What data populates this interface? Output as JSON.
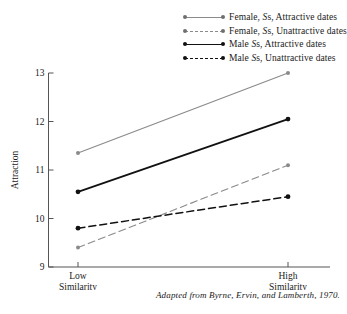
{
  "figure": {
    "caption": "Adapted from Byrne, Ervin, and Lamberth, 1970."
  },
  "legend": {
    "position": "top-right",
    "items": [
      {
        "prefix": "Female, ",
        "sym_italic": "S",
        "sym_roman": "s",
        "suffix": ", Attractive dates",
        "full": "Female, Ss, Attractive dates",
        "color": "#8a8a8a",
        "dash": "solid"
      },
      {
        "prefix": "Female, ",
        "sym_italic": "S",
        "sym_roman": "s",
        "suffix": ", Unattractive dates",
        "full": "Female, Ss, Unattractive dates",
        "color": "#8a8a8a",
        "dash": "dashed"
      },
      {
        "prefix": "Male ",
        "sym_italic": "S",
        "sym_roman": "s",
        "suffix": ", Attractive dates",
        "full": "Male Ss, Attractive dates",
        "color": "#111111",
        "dash": "solid"
      },
      {
        "prefix": "Male ",
        "sym_italic": "S",
        "sym_roman": "s",
        "suffix": ", Unattractive dates",
        "full": "Male Ss, Unattractive dates",
        "color": "#111111",
        "dash": "dashed"
      }
    ]
  },
  "chart_data": {
    "type": "line",
    "title": "",
    "xlabel": "",
    "ylabel": "Attraction",
    "categories": [
      "Low Similarity",
      "High Similarity"
    ],
    "x_tick_labels": [
      {
        "line1": "Low",
        "line2": "Similarity"
      },
      {
        "line1": "High",
        "line2": "Similarity"
      }
    ],
    "y_tick_labels": [
      "9",
      "10",
      "11",
      "12",
      "13"
    ],
    "yticks": [
      9,
      10,
      11,
      12,
      13
    ],
    "ylim": [
      9,
      13
    ],
    "grid": false,
    "legend_position": "top-right",
    "series": [
      {
        "name": "Female, Ss, Attractive dates",
        "values": [
          11.35,
          13.0
        ],
        "color": "#8a8a8a",
        "dash": "solid",
        "marker": "circle"
      },
      {
        "name": "Female, Ss, Unattractive dates",
        "values": [
          9.4,
          11.1
        ],
        "color": "#8a8a8a",
        "dash": "dashed",
        "marker": "circle"
      },
      {
        "name": "Male Ss, Attractive dates",
        "values": [
          10.55,
          12.05
        ],
        "color": "#111111",
        "dash": "solid",
        "marker": "circle"
      },
      {
        "name": "Male Ss, Unattractive dates",
        "values": [
          9.8,
          10.45
        ],
        "color": "#111111",
        "dash": "dashed",
        "marker": "circle"
      }
    ]
  }
}
